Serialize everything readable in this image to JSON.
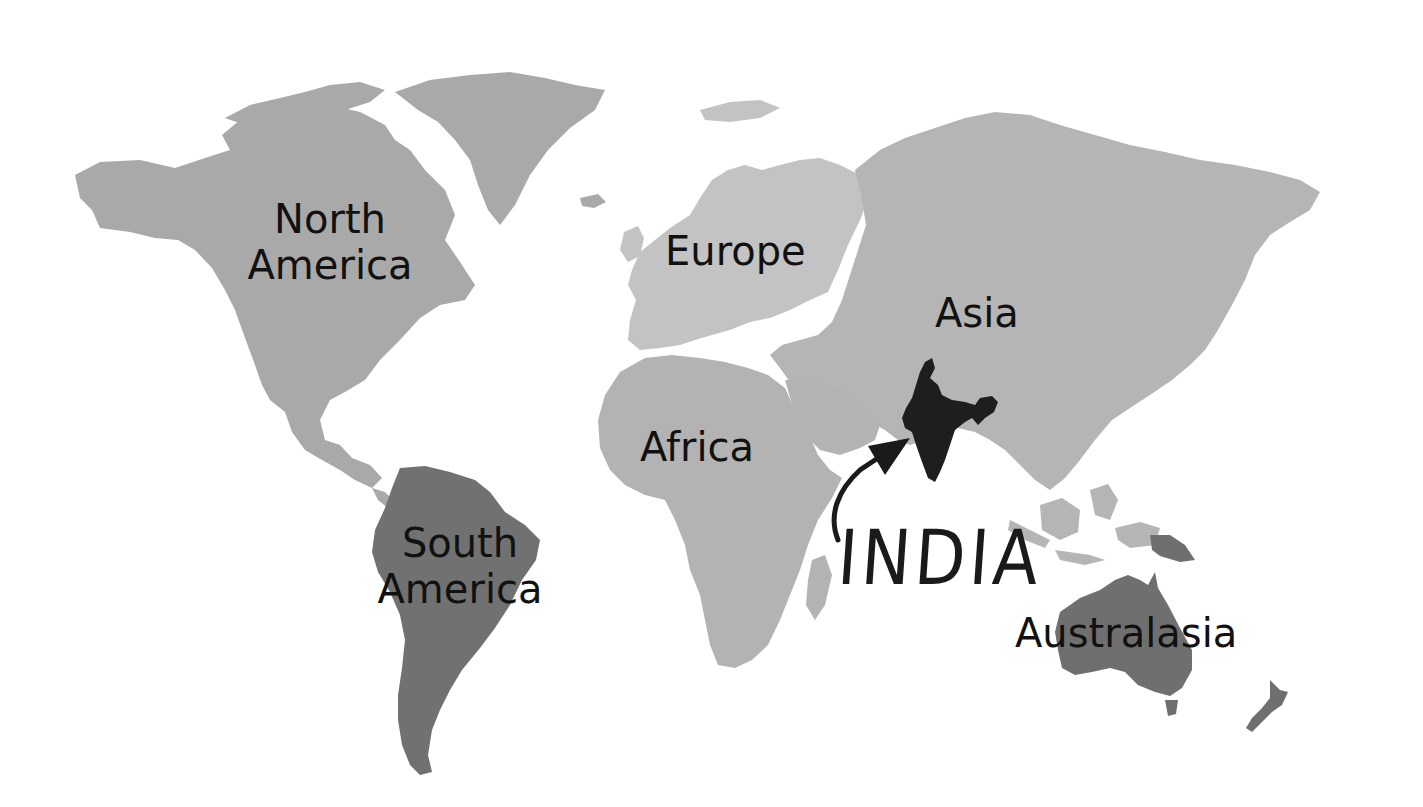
{
  "map": {
    "title": "World map highlighting India",
    "colors": {
      "north_america": "#a9a9a9",
      "europe": "#c3c3c3",
      "asia": "#b5b5b5",
      "africa": "#b3b3b3",
      "south_america": "#717171",
      "australasia": "#6f6f6f",
      "india": "#1e1e1e",
      "background": "#ffffff",
      "text": "#111111"
    },
    "labels": {
      "north_america": "North\nAmerica",
      "europe": "Europe",
      "asia": "Asia",
      "africa": "Africa",
      "south_america": "South\nAmerica",
      "australasia": "Australasia"
    },
    "highlight": {
      "label": "INDIA",
      "pointer": "curved-arrow-pointing-to-india"
    }
  }
}
